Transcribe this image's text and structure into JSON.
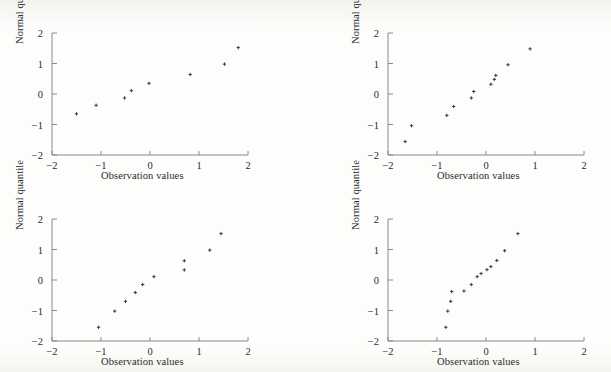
{
  "figure": {
    "panel_count": 4,
    "layout": "2x2",
    "background_color": "#fdfdfb",
    "axis_color": "#8a8a8a",
    "marker_color": "#2b2b2b"
  },
  "labels": {
    "xlabel": "Observation values",
    "ylabel": "Normal quantile",
    "xticks": [
      "-2",
      "-1",
      "0",
      "1",
      "2"
    ],
    "yticks": [
      "2",
      "1",
      "0",
      "-1",
      "-2"
    ]
  },
  "chart_data": [
    {
      "type": "scatter",
      "title": "",
      "xlabel": "Observation values",
      "ylabel": "Normal quantile",
      "xlim": [
        -2,
        2
      ],
      "ylim": [
        -2,
        2
      ],
      "xticks": [
        -2,
        -1,
        0,
        1,
        2
      ],
      "yticks": [
        -2,
        -1,
        0,
        1,
        2
      ],
      "grid": false,
      "legend": "none",
      "marker": "plus",
      "x": [
        -1.5,
        -1.1,
        -0.52,
        -0.38,
        -0.02,
        0.82,
        1.52,
        1.8
      ],
      "y": [
        -0.65,
        -0.37,
        -0.13,
        0.11,
        0.35,
        0.64,
        0.98,
        1.52
      ]
    },
    {
      "type": "scatter",
      "title": "",
      "xlabel": "Observation values",
      "ylabel": "Normal quantile",
      "xlim": [
        -2,
        2
      ],
      "ylim": [
        -2,
        2
      ],
      "xticks": [
        -2,
        -1,
        0,
        1,
        2
      ],
      "yticks": [
        -2,
        -1,
        0,
        1,
        2
      ],
      "grid": false,
      "legend": "none",
      "marker": "plus",
      "x": [
        -1.65,
        -1.52,
        -0.8,
        -0.66,
        -0.3,
        -0.25,
        0.1,
        0.17,
        0.2,
        0.45,
        0.9
      ],
      "y": [
        -1.56,
        -1.04,
        -0.7,
        -0.41,
        -0.13,
        0.08,
        0.32,
        0.48,
        0.61,
        0.96,
        1.48
      ]
    },
    {
      "type": "scatter",
      "title": "",
      "xlabel": "Observation values",
      "ylabel": "Normal quantile",
      "xlim": [
        -2,
        2
      ],
      "ylim": [
        -2,
        2
      ],
      "xticks": [
        -2,
        -1,
        0,
        1,
        2
      ],
      "yticks": [
        -2,
        -1,
        0,
        1,
        2
      ],
      "grid": false,
      "legend": "none",
      "marker": "plus",
      "x": [
        -1.05,
        -0.72,
        -0.5,
        -0.3,
        -0.15,
        0.08,
        0.7,
        0.7,
        1.22,
        1.45
      ],
      "y": [
        -1.55,
        -1.02,
        -0.7,
        -0.41,
        -0.15,
        0.11,
        0.33,
        0.63,
        0.98,
        1.52
      ]
    },
    {
      "type": "scatter",
      "title": "",
      "xlabel": "Observation values",
      "ylabel": "Normal quantile",
      "xlim": [
        -2,
        2
      ],
      "ylim": [
        -2,
        2
      ],
      "xticks": [
        -2,
        -1,
        0,
        1,
        2
      ],
      "yticks": [
        -2,
        -1,
        0,
        1,
        2
      ],
      "grid": false,
      "legend": "none",
      "marker": "plus",
      "x": [
        -0.82,
        -0.78,
        -0.72,
        -0.7,
        -0.45,
        -0.3,
        -0.18,
        -0.1,
        0.02,
        0.1,
        0.22,
        0.38,
        0.65
      ],
      "y": [
        -1.55,
        -1.02,
        -0.7,
        -0.38,
        -0.36,
        -0.15,
        0.11,
        0.21,
        0.34,
        0.44,
        0.64,
        0.96,
        1.52
      ]
    }
  ]
}
